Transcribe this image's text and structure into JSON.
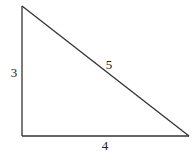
{
  "diagram": {
    "type": "right-triangle",
    "stroke_color": "#333333",
    "background": "#ffffff",
    "vertices": {
      "top": [
        22,
        6
      ],
      "right_angle": [
        22,
        136
      ],
      "right": [
        189,
        136
      ]
    },
    "sides": [
      {
        "name": "vertical-leg",
        "label": "3",
        "label_pos": [
          14,
          77
        ]
      },
      {
        "name": "hypotenuse",
        "label": "5",
        "label_pos": [
          109,
          69
        ]
      },
      {
        "name": "horizontal-leg",
        "label": "4",
        "label_pos": [
          105,
          150
        ]
      }
    ]
  }
}
